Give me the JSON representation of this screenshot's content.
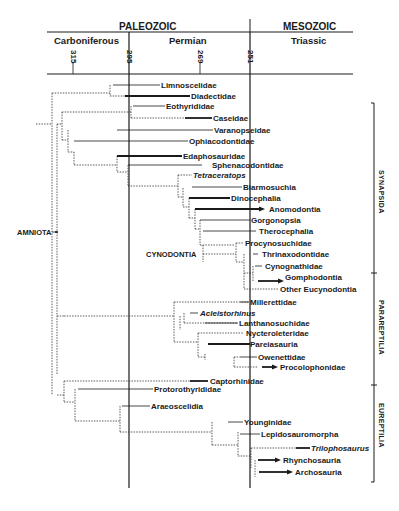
{
  "header": {
    "eras": [
      {
        "label": "PALEOZOIC"
      },
      {
        "label": "MESOZOIC"
      }
    ],
    "periods": [
      {
        "label": "Carboniferous"
      },
      {
        "label": "Permian"
      },
      {
        "label": "Triassic"
      }
    ],
    "ticks": [
      {
        "label": "315"
      },
      {
        "label": "295"
      },
      {
        "label": "269"
      },
      {
        "label": "251"
      }
    ]
  },
  "node_labels": {
    "amniota": "AMNIOTA",
    "cynodontia": "CYNODONTIA"
  },
  "clades": [
    {
      "label": "SYNAPSIDA"
    },
    {
      "label": "PARAREPTILIA"
    },
    {
      "label": "EUREPTILIA"
    }
  ],
  "taxa": [
    {
      "label": "Limnoscelidae"
    },
    {
      "label": "Diadectidae"
    },
    {
      "label": "Eothyrididae"
    },
    {
      "label": "Caseidae"
    },
    {
      "label": "Varanopseidae"
    },
    {
      "label": "Ophiacodontidae"
    },
    {
      "label": "Edaphosauridae"
    },
    {
      "label": "Sphenacodontidae"
    },
    {
      "label": "Tetraceratops"
    },
    {
      "label": "Biarmosuchia"
    },
    {
      "label": "Dinocephalia"
    },
    {
      "label": "Anomodontia"
    },
    {
      "label": "Gorgonopsia"
    },
    {
      "label": "Therocephalia"
    },
    {
      "label": "Procynosuchidae"
    },
    {
      "label": "Thrinaxodontidae"
    },
    {
      "label": "Cynognathidae"
    },
    {
      "label": "Gomphodontia"
    },
    {
      "label": "Other Eucynodontia"
    },
    {
      "label": "Millerettidae"
    },
    {
      "label": "Acleistorhinus"
    },
    {
      "label": "Lanthanosuchidae"
    },
    {
      "label": "Nycteroleteridae"
    },
    {
      "label": "Pareiasauria"
    },
    {
      "label": "Owenettidae"
    },
    {
      "label": "Procolophonidae"
    },
    {
      "label": "Captorhinidae"
    },
    {
      "label": "Protorothyrididae"
    },
    {
      "label": "Araeoscelidia"
    },
    {
      "label": "Younginidae"
    },
    {
      "label": "Lepidosauromorpha"
    },
    {
      "label": "Trilophosaurus"
    },
    {
      "label": "Rhynchosauria"
    },
    {
      "label": "Archosauria"
    }
  ]
}
